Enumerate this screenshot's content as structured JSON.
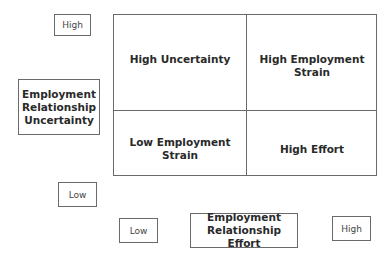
{
  "y_axis": {
    "high_label": "High",
    "low_label": "Low",
    "title": "Employment Relationship Uncertainty"
  },
  "x_axis": {
    "low_label": "Low",
    "high_label": "High",
    "title": "Employment Relationship Effort"
  },
  "quadrants": {
    "top_left": "High Uncertainty",
    "top_right_line1": "High Employment",
    "top_right_line2": "Strain",
    "bottom_left_word1": "Low",
    "bottom_left_word2": "Employment",
    "bottom_left_line2": "Strain",
    "bottom_right": "High Effort"
  },
  "y_title_lines": [
    "Employment",
    "Relationship",
    "Uncertainty"
  ],
  "x_title_lines": [
    "Employment",
    "Relationship Effort"
  ]
}
